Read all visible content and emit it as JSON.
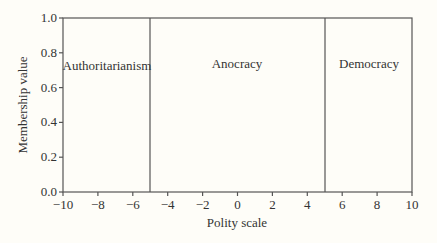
{
  "chart_data": {
    "type": "line",
    "title": "",
    "xlabel": "Polity scale",
    "ylabel": "Membership value",
    "xlim": [
      -10,
      10
    ],
    "ylim": [
      0.0,
      1.0
    ],
    "xticks": [
      -10,
      -8,
      -6,
      -4,
      -2,
      0,
      2,
      4,
      6,
      8,
      10
    ],
    "xtick_labels": [
      "−10",
      "−8",
      "−6",
      "−4",
      "−2",
      "0",
      "2",
      "4",
      "6",
      "8",
      "10"
    ],
    "yticks": [
      0.0,
      0.2,
      0.4,
      0.6,
      0.8,
      1.0
    ],
    "ytick_labels": [
      "0.0",
      "0.2",
      "0.4",
      "0.6",
      "0.8",
      "1.0"
    ],
    "grid": false,
    "vertical_lines": [
      -5,
      5
    ],
    "regions": [
      {
        "name": "Authoritarianism",
        "x_range": [
          -10,
          -5
        ],
        "membership": 1.0
      },
      {
        "name": "Anocracy",
        "x_range": [
          -5,
          5
        ],
        "membership": 1.0
      },
      {
        "name": "Democracy",
        "x_range": [
          5,
          10
        ],
        "membership": 1.0
      }
    ]
  },
  "labels": {
    "region1": "Authoritarianism",
    "region2": "Anocracy",
    "region3": "Democracy",
    "xlabel": "Polity scale",
    "ylabel": "Membership value"
  }
}
